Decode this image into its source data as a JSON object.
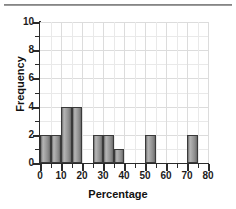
{
  "chart_data": {
    "type": "bar",
    "title": "",
    "subtitle": "",
    "xlabel": "Percentage",
    "ylabel": "Frequency",
    "xlim": [
      0,
      80
    ],
    "ylim": [
      0,
      10
    ],
    "bin_width": 5,
    "grid": true,
    "legend": null,
    "x_major_ticks": [
      0,
      10,
      20,
      30,
      40,
      50,
      60,
      70,
      80
    ],
    "x_minor_ticks": [
      5,
      15,
      25,
      35,
      45,
      55,
      65,
      75
    ],
    "y_major_ticks": [
      0,
      2,
      4,
      6,
      8,
      10
    ],
    "y_minor_ticks": [
      1,
      3,
      5,
      7,
      9
    ],
    "x_tick_labels": [
      "0",
      "10",
      "20",
      "30",
      "40",
      "50",
      "60",
      "70",
      "80"
    ],
    "y_tick_labels": [
      "0",
      "2",
      "4",
      "6",
      "8",
      "10"
    ],
    "bins": [
      {
        "start": 0,
        "end": 5,
        "value": 2
      },
      {
        "start": 5,
        "end": 10,
        "value": 2
      },
      {
        "start": 10,
        "end": 15,
        "value": 4
      },
      {
        "start": 15,
        "end": 20,
        "value": 4
      },
      {
        "start": 20,
        "end": 25,
        "value": 0
      },
      {
        "start": 25,
        "end": 30,
        "value": 2
      },
      {
        "start": 30,
        "end": 35,
        "value": 2
      },
      {
        "start": 35,
        "end": 40,
        "value": 1
      },
      {
        "start": 40,
        "end": 45,
        "value": 0
      },
      {
        "start": 45,
        "end": 50,
        "value": 0
      },
      {
        "start": 50,
        "end": 55,
        "value": 2
      },
      {
        "start": 55,
        "end": 60,
        "value": 0
      },
      {
        "start": 60,
        "end": 65,
        "value": 0
      },
      {
        "start": 65,
        "end": 70,
        "value": 0
      },
      {
        "start": 70,
        "end": 75,
        "value": 2
      },
      {
        "start": 75,
        "end": 80,
        "value": 0
      }
    ],
    "categories": [
      "0-5",
      "5-10",
      "10-15",
      "15-20",
      "20-25",
      "25-30",
      "30-35",
      "35-40",
      "40-45",
      "45-50",
      "50-55",
      "55-60",
      "60-65",
      "65-70",
      "70-75",
      "75-80"
    ],
    "values": [
      2,
      2,
      4,
      4,
      0,
      2,
      2,
      1,
      0,
      0,
      2,
      0,
      0,
      0,
      2,
      0
    ],
    "colors": {
      "bar_fill_light": "#b6b6b6",
      "bar_fill_dark": "#6a6a6a",
      "bar_border": "#3a3a3a",
      "axis": "#2b2b2b",
      "grid": "#e9e9e9",
      "text": "#111111",
      "background": "#ffffff"
    }
  }
}
